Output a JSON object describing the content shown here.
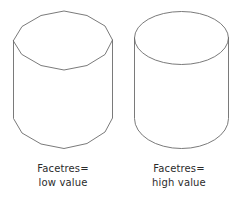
{
  "figure": {
    "background_color": "#ffffff",
    "line_color": "#6b6b6b",
    "text_color": "#2b2b2b",
    "width": 238,
    "height": 206
  },
  "shapes": [
    {
      "name": "faceted-cylinder",
      "style": "low-facet-resolution",
      "facets": 12,
      "top_shape": "polygon",
      "bottom_shape": "polygon",
      "fill": "none"
    },
    {
      "name": "smooth-cylinder",
      "style": "high-facet-resolution",
      "facets": 0,
      "top_shape": "ellipse",
      "bottom_shape": "ellipse",
      "fill": "none"
    }
  ],
  "captions": {
    "left": {
      "line1": "Facetres=",
      "line2": "low value"
    },
    "right": {
      "line1": "Facetres=",
      "line2": "high value"
    }
  }
}
